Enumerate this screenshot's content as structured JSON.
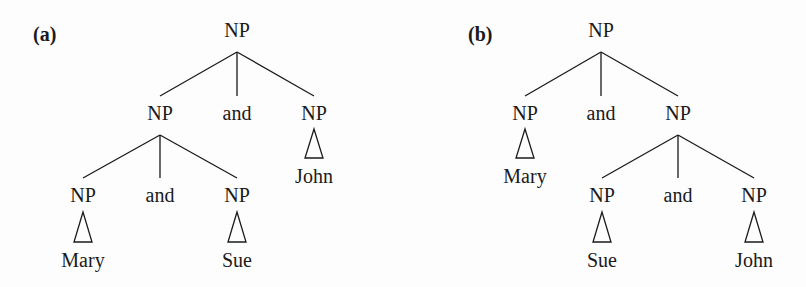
{
  "figure": {
    "panels": [
      {
        "label": "(a)",
        "root": "NP",
        "level1": {
          "left": "NP",
          "conj": "and",
          "right": "NP"
        },
        "level2": {
          "left": "NP",
          "conj": "and",
          "right": "NP"
        },
        "leaves": {
          "left": "Mary",
          "mid": "Sue",
          "right": "John"
        }
      },
      {
        "label": "(b)",
        "root": "NP",
        "level1": {
          "left": "NP",
          "conj": "and",
          "right": "NP"
        },
        "level2": {
          "left": "NP",
          "conj": "and",
          "right": "NP"
        },
        "leaves": {
          "left": "Mary",
          "mid": "Sue",
          "right": "John"
        }
      }
    ],
    "line_color": "#1a1a1a",
    "background": "#fdfdfd"
  }
}
